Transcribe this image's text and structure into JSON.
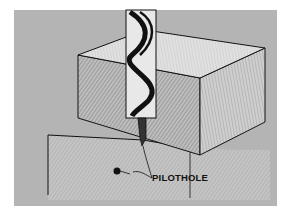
{
  "figure": {
    "labels": {
      "pilot_hole": "PILOTHOLE"
    },
    "colors": {
      "background": "#b4b4b4",
      "ink": "#111111",
      "block_face": "#c8c8c8",
      "highlight": "#e6e6e6"
    }
  }
}
